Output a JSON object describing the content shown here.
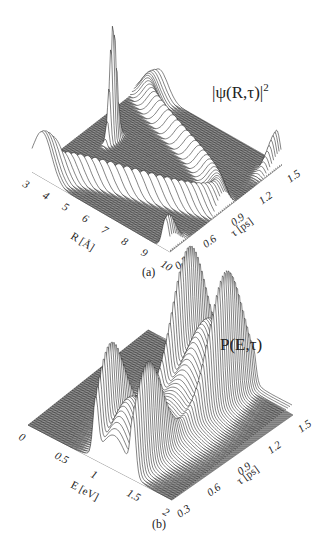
{
  "chart_data": [
    {
      "type": "surface",
      "panel_label": "(a)",
      "title": "|ψ(R,τ)|²",
      "xlabel": "R [Å]",
      "ylabel": "τ [ps]",
      "x_ticks": [
        "3",
        "4",
        "5",
        "6",
        "7",
        "8",
        "9",
        "10"
      ],
      "y_ticks": [
        "0.3",
        "0.6",
        "0.9",
        "1.2",
        "1.5"
      ],
      "xlim": [
        3,
        10
      ],
      "ylim": [
        0.3,
        1.5
      ],
      "grid": false,
      "legend": null,
      "description": "Waterfall plot of wave-packet probability density oscillating in R vs delay τ; sharp spike near R≈4 Å at τ≈0.9 ps, broad ridges sweeping between inner and outer turning points, outer peak near R≈10 Å at τ≈1.5 ps.",
      "features": [
        {
          "name": "inner-spike",
          "R": 4.2,
          "tau": 0.95,
          "relative_height": 1.0
        },
        {
          "name": "outer-edge-peak-early",
          "R": 9.8,
          "tau": 0.35,
          "relative_height": 0.28
        },
        {
          "name": "outer-edge-peak-late",
          "R": 9.8,
          "tau": 1.5,
          "relative_height": 0.3
        },
        {
          "name": "inner-edge-shoulder",
          "R": 3.3,
          "tau": 0.3,
          "relative_height": 0.2
        }
      ]
    },
    {
      "type": "surface",
      "panel_label": "(b)",
      "title": "P(E,τ)",
      "xlabel": "E [eV]",
      "ylabel": "τ [ps]",
      "x_ticks": [
        "0",
        "0.5",
        "1",
        "1.5",
        "2"
      ],
      "y_ticks": [
        "0.3",
        "0.6",
        "0.9",
        "1.2",
        "1.5"
      ],
      "xlim": [
        0,
        2
      ],
      "ylim": [
        0.3,
        1.5
      ],
      "grid": false,
      "legend": null,
      "description": "Waterfall plot of photoelectron energy distribution vs delay τ; pairs of sharp peaks near E≈1.0 and E≈1.5 eV at τ≈0.3 and τ≈1.2 ps, joined by curved ridges.",
      "features": [
        {
          "name": "peak-1",
          "E": 0.95,
          "tau": 0.45,
          "relative_height": 0.75
        },
        {
          "name": "peak-2",
          "E": 1.45,
          "tau": 0.45,
          "relative_height": 0.75
        },
        {
          "name": "peak-3",
          "E": 0.95,
          "tau": 1.2,
          "relative_height": 1.0
        },
        {
          "name": "peak-4",
          "E": 1.45,
          "tau": 1.2,
          "relative_height": 0.95
        },
        {
          "name": "ridge-hump-1",
          "E": 1.2,
          "tau": 0.45,
          "relative_height": 0.5
        },
        {
          "name": "ridge-hump-2",
          "E": 1.2,
          "tau": 1.2,
          "relative_height": 0.7
        }
      ]
    }
  ],
  "panels": {
    "a": {
      "title": "|ψ(R,τ)|",
      "title_sup": "2",
      "caption": "(a)",
      "xlabel": "R [Å]",
      "ylabel": "τ [ps]",
      "x_ticks": [
        "3",
        "4",
        "5",
        "6",
        "7",
        "8",
        "9",
        "10"
      ],
      "y_ticks": [
        "0.3",
        "0.6",
        "0.9",
        "1.2",
        "1.5"
      ]
    },
    "b": {
      "title": "P(E,τ)",
      "caption": "(b)",
      "xlabel": "E [eV]",
      "ylabel": "τ [ps]",
      "x_ticks": [
        "0",
        "0.5",
        "1",
        "1.5",
        "2"
      ],
      "y_ticks": [
        "0.3",
        "0.6",
        "0.9",
        "1.2",
        "1.5"
      ]
    }
  },
  "colors": {
    "plane": "#8a8a8a",
    "surface_fill": "#ffffff",
    "surface_line": "#1e1e1e"
  }
}
